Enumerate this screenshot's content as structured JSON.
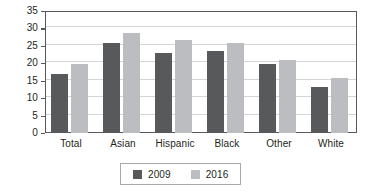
{
  "chart_data": {
    "type": "bar",
    "title": "",
    "xlabel": "",
    "ylabel": "Percent",
    "ylim": [
      0,
      35
    ],
    "ytick_step": 5,
    "yticks": [
      0,
      5,
      10,
      15,
      20,
      25,
      30,
      35
    ],
    "grid": true,
    "legend_position": "bottom",
    "categories": [
      "Total",
      "Asian",
      "Hispanic",
      "Black",
      "Other",
      "White"
    ],
    "series": [
      {
        "name": "2009",
        "color": "#58595b",
        "values": [
          16.8,
          25.9,
          23.0,
          23.5,
          19.9,
          13.1
        ]
      },
      {
        "name": "2016",
        "color": "#bcbdc0",
        "values": [
          19.9,
          28.8,
          26.6,
          25.7,
          21.0,
          15.9
        ]
      }
    ]
  },
  "colors": {
    "series_2009": "#58595b",
    "series_2016": "#bcbdc0",
    "axis": "#58595b",
    "gridline": "#d4d5d7",
    "text": "#231f20",
    "legend_border": "#a7a9ac",
    "background": "#ffffff"
  }
}
